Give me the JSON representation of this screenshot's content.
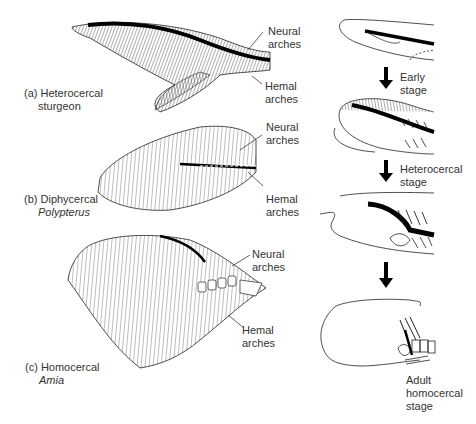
{
  "panels": {
    "a": {
      "label_line1": "(a) Heterocercal",
      "label_line2": "sturgeon",
      "neural": [
        "Neural",
        "arches"
      ],
      "hemal": [
        "Hemal",
        "arches"
      ]
    },
    "b": {
      "label_line1": "(b) Diphycercal",
      "label_line2": "Polypterus",
      "neural": [
        "Neural",
        "arches"
      ],
      "hemal": [
        "Hemal",
        "arches"
      ]
    },
    "c": {
      "label_line1": "(c) Homocercal",
      "label_line2": "Amia",
      "neural": [
        "Neural",
        "arches"
      ],
      "hemal": [
        "Hemal",
        "arches"
      ]
    }
  },
  "development": {
    "stage1": [
      "Early",
      "stage"
    ],
    "stage2": [
      "Heterocercal",
      "stage"
    ],
    "stage3": [
      "Adult",
      "homocercal",
      "stage"
    ]
  },
  "colors": {
    "ink": "#111111",
    "background": "#ffffff"
  }
}
